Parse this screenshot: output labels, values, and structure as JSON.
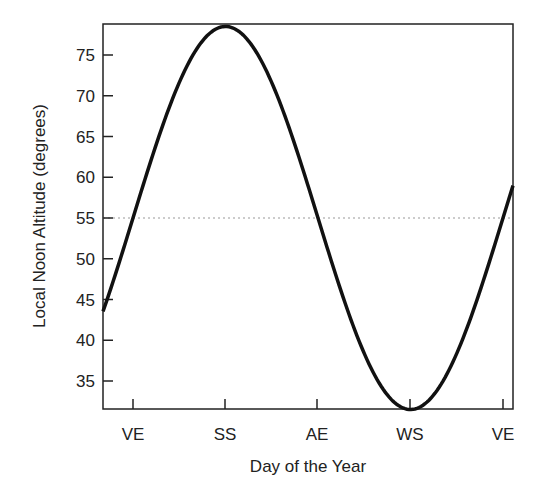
{
  "chart_data": {
    "type": "line",
    "title": "",
    "xlabel": "Day of the Year",
    "ylabel": "Local Noon Altitude (degrees)",
    "x_tick_labels": [
      "VE",
      "SS",
      "AE",
      "WS",
      "VE"
    ],
    "y_ticks": [
      35,
      40,
      45,
      50,
      55,
      60,
      65,
      70,
      75
    ],
    "ylim": [
      31.6,
      78.8
    ],
    "grid": false,
    "reference_line": {
      "y": 55,
      "style": "dotted"
    },
    "series": [
      {
        "name": "Local noon altitude",
        "x": [
          "start",
          "VE",
          "SS",
          "AE",
          "WS",
          "VE",
          "end"
        ],
        "values": [
          44,
          55,
          78.5,
          55,
          31.5,
          55,
          60
        ]
      }
    ],
    "curve": {
      "mean": 55,
      "amplitude": 23.5,
      "peak_at": "SS",
      "trough_at": "WS"
    }
  }
}
